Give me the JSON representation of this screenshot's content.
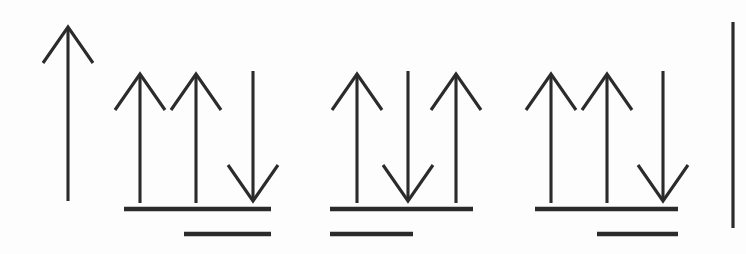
{
  "figure": {
    "background_color": "#fdfdfd",
    "ink_color": "#2b2b2b",
    "canvas": {
      "width": 746,
      "height": 254
    }
  },
  "style": {
    "arrow_stroke_width": 3.1,
    "level_stroke_width": 4.6,
    "edge_rule_stroke_width": 3.2,
    "arrow_head_half_width": 25,
    "arrow_head_length": 36
  },
  "groups": [
    {
      "id": "group-1",
      "name": "single-up-arrow",
      "arrow_count": 1,
      "spins": [
        "up"
      ],
      "arrows": [
        {
          "name": "arrow-up-1",
          "direction": "up",
          "x": 68,
          "y_top": 27,
          "y_bottom": 201
        }
      ],
      "levels": []
    },
    {
      "id": "group-2",
      "name": "up-up-down-group",
      "arrow_count": 3,
      "spins": [
        "up",
        "up",
        "down"
      ],
      "arrows": [
        {
          "name": "arrow-up-1",
          "direction": "up",
          "x": 140,
          "y_top": 74,
          "y_bottom": 203
        },
        {
          "name": "arrow-up-2",
          "direction": "up",
          "x": 196,
          "y_top": 74,
          "y_bottom": 203
        },
        {
          "name": "arrow-down-1",
          "direction": "down",
          "x": 253,
          "y_top": 71,
          "y_bottom": 201
        }
      ],
      "levels": [
        {
          "name": "level-line-upper",
          "x_start": 124,
          "x_end": 271,
          "y": 209,
          "align": "full"
        },
        {
          "name": "level-line-lower",
          "x_start": 184,
          "x_end": 271,
          "y": 234,
          "align": "right"
        }
      ]
    },
    {
      "id": "group-3",
      "name": "up-down-up-group",
      "arrow_count": 3,
      "spins": [
        "up",
        "down",
        "up"
      ],
      "arrows": [
        {
          "name": "arrow-up-1",
          "direction": "up",
          "x": 357,
          "y_top": 74,
          "y_bottom": 203
        },
        {
          "name": "arrow-down-1",
          "direction": "down",
          "x": 408,
          "y_top": 71,
          "y_bottom": 201
        },
        {
          "name": "arrow-up-2",
          "direction": "up",
          "x": 456,
          "y_top": 74,
          "y_bottom": 203
        }
      ],
      "levels": [
        {
          "name": "level-line-upper",
          "x_start": 330,
          "x_end": 473,
          "y": 209,
          "align": "full"
        },
        {
          "name": "level-line-lower",
          "x_start": 330,
          "x_end": 413,
          "y": 234,
          "align": "left"
        }
      ]
    },
    {
      "id": "group-4",
      "name": "up-up-down-group",
      "arrow_count": 3,
      "spins": [
        "up",
        "up",
        "down"
      ],
      "arrows": [
        {
          "name": "arrow-up-1",
          "direction": "up",
          "x": 551,
          "y_top": 74,
          "y_bottom": 203
        },
        {
          "name": "arrow-up-2",
          "direction": "up",
          "x": 607,
          "y_top": 74,
          "y_bottom": 203
        },
        {
          "name": "arrow-down-1",
          "direction": "down",
          "x": 663,
          "y_top": 71,
          "y_bottom": 201
        }
      ],
      "levels": [
        {
          "name": "level-line-upper",
          "x_start": 535,
          "x_end": 678,
          "y": 209,
          "align": "full"
        },
        {
          "name": "level-line-lower",
          "x_start": 597,
          "x_end": 678,
          "y": 234,
          "align": "right"
        }
      ]
    }
  ],
  "edge_rule": {
    "name": "right-vertical-rule",
    "x": 733,
    "y_top": 22,
    "y_bottom": 228
  }
}
